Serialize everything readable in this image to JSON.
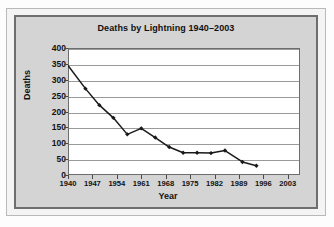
{
  "chart_data": {
    "type": "line",
    "title": "Deaths by Lightning 1940–2003",
    "xlabel": "Year",
    "ylabel": "Deaths",
    "xlim": [
      1940,
      2006.5
    ],
    "ylim": [
      0,
      400
    ],
    "grid": true,
    "legend": "none",
    "marker": "diamond",
    "line_color": "#1a1a1a",
    "marker_color": "#1a1a1a",
    "plot_background": "#ffffff",
    "panel_background": "#d4d4d4",
    "gridline_color": "#9a9a9a",
    "y_ticks": [
      0,
      50,
      100,
      150,
      200,
      250,
      300,
      350,
      400
    ],
    "x_ticks": [
      1940,
      1947,
      1954,
      1961,
      1968,
      1975,
      1982,
      1989,
      1996,
      2003
    ],
    "x": [
      1940,
      1944,
      1948,
      1952,
      1956,
      1960,
      1964,
      1968,
      1972,
      1976,
      1980,
      1984,
      1988,
      1992,
      1996,
      2000,
      2003
    ],
    "values": [
      345,
      272,
      220,
      180,
      128,
      147,
      118,
      88,
      70,
      70,
      69,
      77,
      41,
      29,
      70,
      77,
      29
    ],
    "points": [
      {
        "x": 1940,
        "y": 345
      },
      {
        "x": 1945,
        "y": 272
      },
      {
        "x": 1949,
        "y": 220
      },
      {
        "x": 1953,
        "y": 180
      },
      {
        "x": 1957,
        "y": 128
      },
      {
        "x": 1961,
        "y": 147
      },
      {
        "x": 1965,
        "y": 118
      },
      {
        "x": 1969,
        "y": 88
      },
      {
        "x": 1973,
        "y": 70
      },
      {
        "x": 1977,
        "y": 70
      },
      {
        "x": 1981,
        "y": 69
      },
      {
        "x": 1985,
        "y": 77
      },
      {
        "x": 1990,
        "y": 41
      },
      {
        "x": 1994,
        "y": 29
      }
    ]
  }
}
